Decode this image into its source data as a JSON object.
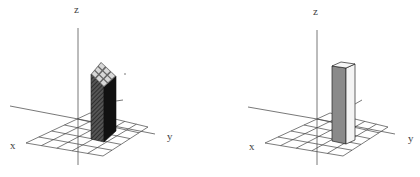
{
  "figure": {
    "panels": [
      {
        "id": "left",
        "axis_labels": {
          "x": "x",
          "y": "y",
          "z": "z"
        },
        "grid_cells": 5,
        "bar": {
          "front_shading": "dark hatched",
          "side_shading": "black",
          "top": "3x3 checker grid"
        }
      },
      {
        "id": "right",
        "axis_labels": {
          "x": "x",
          "y": "y",
          "z": "z"
        },
        "grid_cells": 5,
        "bar": {
          "front_shading": "medium gray",
          "side_shading": "white",
          "top": "white"
        }
      }
    ],
    "colors": {
      "axis": "#555555",
      "grid": "#444444",
      "left_front": "#3a3a3a",
      "left_side": "#111111",
      "left_top_cell": "#d8d8d8",
      "right_front": "#8a8a8a",
      "right_side": "#f4f4f4",
      "right_top": "#f7f7f7"
    }
  }
}
